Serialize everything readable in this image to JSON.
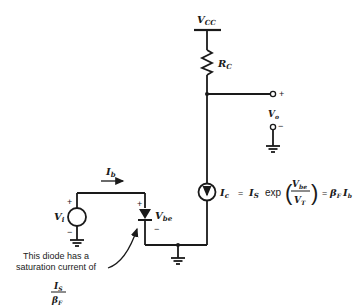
{
  "diagram": {
    "type": "circuit",
    "supply": {
      "label": "V",
      "sub": "CC"
    },
    "resistor": {
      "label": "R",
      "sub": "C"
    },
    "output": {
      "label": "V",
      "sub": "o",
      "plus": "+",
      "minus": "−"
    },
    "input_source": {
      "label": "V",
      "sub": "i",
      "plus": "+",
      "minus": "−"
    },
    "base_current": {
      "label": "I",
      "sub": "b"
    },
    "diode": {
      "label": "V",
      "sub": "be",
      "plus": "+",
      "minus": "−"
    },
    "current_source": {
      "lhs_label": "I",
      "lhs_sub": "c",
      "eq1": "=",
      "is_label": "I",
      "is_sub": "S",
      "func": "exp",
      "frac_num": "V",
      "frac_num_sub": "be",
      "frac_den": "V",
      "frac_den_sub": "T",
      "eq2": "=",
      "beta": "β",
      "beta_sub": "F",
      "ib": "I",
      "ib_sub": "b"
    },
    "annotation": {
      "line1": "This diode has a",
      "line2": "saturation current of",
      "frac_num": "I",
      "frac_num_sub": "S",
      "frac_den": "β",
      "frac_den_sub": "F"
    }
  }
}
